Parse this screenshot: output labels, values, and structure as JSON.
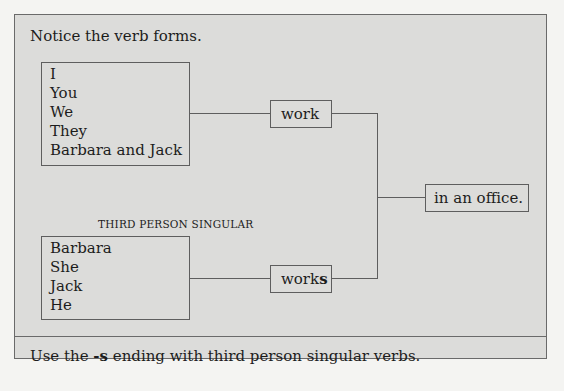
{
  "title": "Notice the verb forms.",
  "group_plural": {
    "subjects": [
      "I",
      "You",
      "We",
      "They",
      "Barbara and Jack"
    ],
    "verb": "work"
  },
  "group_singular": {
    "heading": "THIRD PERSON SINGULAR",
    "subjects": [
      "Barbara",
      "She",
      "Jack",
      "He"
    ],
    "verb_stem": "work",
    "verb_ending": "s"
  },
  "complement": "in an office.",
  "footer": {
    "before": "Use the ",
    "emphasis": "-s",
    "after": " ending with third person singular verbs."
  }
}
